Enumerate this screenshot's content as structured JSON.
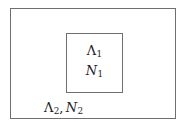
{
  "figure": {
    "type": "nested-region-diagram",
    "background_color": "#ffffff",
    "line_color": "#6f6f6f",
    "text_color": "#1c1c1c",
    "outer_region": {
      "name": "outer-region",
      "label_parts": {
        "lambda_symbol": "Λ",
        "lambda_subscript": "2",
        "separator": ",",
        "n_symbol": "N",
        "n_subscript": "2"
      },
      "label_text": "Λ₂, N₂"
    },
    "inner_region": {
      "name": "inner-region",
      "lambda_label": {
        "symbol": "Λ",
        "subscript": "1",
        "text": "Λ₁"
      },
      "n_label": {
        "symbol": "N",
        "subscript": "1",
        "text": "N₁"
      }
    }
  }
}
